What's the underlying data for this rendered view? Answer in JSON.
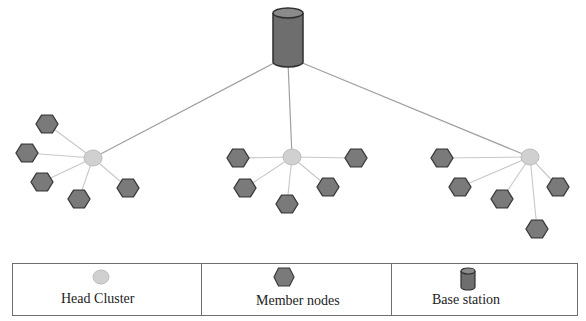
{
  "diagram": {
    "type": "network-topology",
    "colors": {
      "head_fill": "#d0d0d0",
      "head_stroke": "#bcbcbc",
      "member_fill": "#7a7a7a",
      "member_stroke": "#3a3a3a",
      "base_fill": "#6e6e6e",
      "base_top": "#8a8a8a",
      "base_stroke": "#2f2f2f",
      "link_member": "#c8c8c8",
      "link_base": "#a0a0a0"
    },
    "base_station": {
      "x": 288,
      "y": 36,
      "label": "Base station"
    },
    "clusters": [
      {
        "head": {
          "x": 93,
          "y": 158
        },
        "members": [
          {
            "x": 47,
            "y": 124
          },
          {
            "x": 27,
            "y": 153
          },
          {
            "x": 42,
            "y": 182
          },
          {
            "x": 79,
            "y": 199
          },
          {
            "x": 128,
            "y": 188
          }
        ]
      },
      {
        "head": {
          "x": 292,
          "y": 157
        },
        "members": [
          {
            "x": 238,
            "y": 158
          },
          {
            "x": 245,
            "y": 188
          },
          {
            "x": 287,
            "y": 204
          },
          {
            "x": 328,
            "y": 187
          },
          {
            "x": 356,
            "y": 158
          }
        ]
      },
      {
        "head": {
          "x": 530,
          "y": 157
        },
        "members": [
          {
            "x": 442,
            "y": 158
          },
          {
            "x": 460,
            "y": 187
          },
          {
            "x": 502,
            "y": 199
          },
          {
            "x": 558,
            "y": 187
          },
          {
            "x": 537,
            "y": 229
          }
        ]
      }
    ]
  },
  "legend": {
    "items": [
      {
        "icon": "head-cluster-circle-icon",
        "label": "Head Cluster"
      },
      {
        "icon": "member-node-hexagon-icon",
        "label": "Member nodes"
      },
      {
        "icon": "base-station-cylinder-icon",
        "label": "Base station"
      }
    ]
  }
}
